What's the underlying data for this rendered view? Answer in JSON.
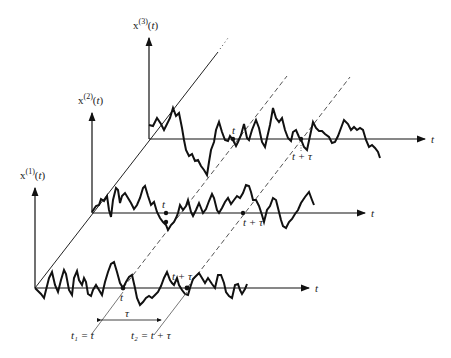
{
  "figure": {
    "axes": [
      {
        "id": 1,
        "ylabel_base": "x",
        "ylabel_sup": "(1)",
        "ylabel_arg": "(t)",
        "xlabel": "t",
        "point_t_label": "t",
        "point_ttau_label": "t + τ"
      },
      {
        "id": 2,
        "ylabel_base": "x",
        "ylabel_sup": "(2)",
        "ylabel_arg": "(t)",
        "xlabel": "t",
        "point_t_label": "t",
        "point_ttau_label": "t + τ"
      },
      {
        "id": 3,
        "ylabel_base": "x",
        "ylabel_sup": "(3)",
        "ylabel_arg": "(t)",
        "xlabel": "t",
        "point_t_label": "t",
        "point_ttau_label": "t + τ"
      }
    ],
    "annotations": {
      "t1": "t₁ = t",
      "t2": "t₂ = t + τ",
      "tau": "τ"
    },
    "colors": {
      "line": "#111111",
      "text": "#222222",
      "dashed": "#555555"
    }
  }
}
